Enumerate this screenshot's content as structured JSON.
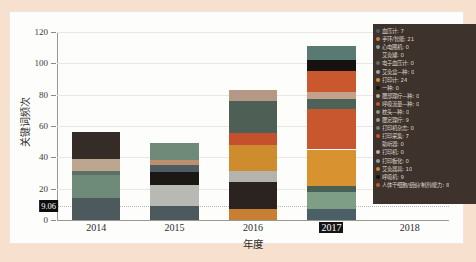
{
  "page": {
    "top_note": "",
    "background_color": "#f7e0cd",
    "card_color": "#fdfdfb"
  },
  "chart_data": {
    "type": "bar",
    "subtype": "stacked",
    "title": "",
    "xlabel": "年度",
    "ylabel": "关键词频次",
    "categories": [
      "2014",
      "2015",
      "2016",
      "2017",
      "2018"
    ],
    "highlighted_category": "2017",
    "ylim": [
      0,
      120
    ],
    "yticks": [
      0,
      20,
      40,
      60,
      80,
      100,
      120
    ],
    "grid": true,
    "legend_position": "right-inside",
    "threshold": {
      "value": 9.06,
      "label": "9.06"
    },
    "totals": [
      56,
      49,
      83,
      111,
      0
    ],
    "stacks": [
      {
        "category": "2014",
        "total": 56,
        "segments": [
          {
            "name": "血压计",
            "value": 14,
            "color": "#4c5a5e"
          },
          {
            "name": "手环/智能手表",
            "value": 15,
            "color": "#6e8a78"
          },
          {
            "name": "心电图机",
            "value": 2,
            "color": "#5d6f66"
          },
          {
            "name": "艾灸罐",
            "value": 8,
            "color": "#bda68f"
          },
          {
            "name": "电子血压计",
            "value": 17,
            "color": "#352b27"
          }
        ]
      },
      {
        "category": "2015",
        "total": 49,
        "segments": [
          {
            "name": "血压计",
            "value": 9,
            "color": "#4c5a5e"
          },
          {
            "name": "艾灸盒",
            "value": 13.5,
            "color": "#b9b9b3"
          },
          {
            "name": "打印机",
            "value": 8,
            "color": "#1b1714"
          },
          {
            "name": "一种",
            "value": 4.5,
            "color": "#4e5c63"
          },
          {
            "name": "腰部理疗",
            "value": 3,
            "color": "#bd8f6e"
          },
          {
            "name": "呼吸流量",
            "value": 11,
            "color": "#6f8a78"
          }
        ]
      },
      {
        "category": "2016",
        "total": 83,
        "segments": [
          {
            "name": "枕头",
            "value": 7,
            "color": "#c67f33"
          },
          {
            "name": "腰定理疗",
            "value": 17.5,
            "color": "#2b231f"
          },
          {
            "name": "打印机杂志",
            "value": 6.5,
            "color": "#b4b4ae"
          },
          {
            "name": "打印采集",
            "value": 17,
            "color": "#cf8c2e"
          },
          {
            "name": "助听器",
            "value": 7.5,
            "color": "#c4502d"
          },
          {
            "name": "打印机",
            "value": 20.5,
            "color": "#4e6055"
          },
          {
            "name": "打印板化",
            "value": 7,
            "color": "#b49a86"
          }
        ]
      },
      {
        "category": "2017",
        "total": 111,
        "segments": [
          {
            "name": "血压计",
            "value": 7,
            "color": "#4b6066"
          },
          {
            "name": "手环/智能手表",
            "value": 11,
            "color": "#7e9e86"
          },
          {
            "name": "心电图机",
            "value": 4,
            "color": "#4a6054"
          },
          {
            "name": "打印计",
            "value": 23,
            "color": "#d8922f"
          },
          {
            "name": "艾灸器具",
            "value": 26,
            "color": "#c8572f"
          },
          {
            "name": "呼吸机",
            "value": 6,
            "color": "#4f6257"
          },
          {
            "name": "腰定理疗",
            "value": 5,
            "color": "#c3a18a"
          },
          {
            "name": "打印采集",
            "value": 13,
            "color": "#c9582f"
          },
          {
            "name": "人体干细胞",
            "value": 7,
            "color": "#16120f"
          },
          {
            "name": "打印机",
            "value": 9,
            "color": "#597a73"
          }
        ]
      },
      {
        "category": "2018",
        "total": 0,
        "segments": []
      }
    ]
  },
  "legend": {
    "background_color": "#3d322c",
    "items": [
      {
        "label": "血压计: 7",
        "color": "#4b6066"
      },
      {
        "label": "手环/智能: 21",
        "color": "#c8823a"
      },
      {
        "label": "心电图机: 0",
        "color": "#8aa092"
      },
      {
        "label": "艾灸罐: 0",
        "color": "#3d322c"
      },
      {
        "label": "电子血压计: 0",
        "color": "#5a6f64"
      },
      {
        "label": "艾灸盒—种: 0",
        "color": "#9aa8a0"
      },
      {
        "label": "打印计: 24",
        "color": "#d8922f"
      },
      {
        "label": "一种: 0",
        "color": "#14110f"
      },
      {
        "label": "腰部理疗—种: 0",
        "color": "#b9a894"
      },
      {
        "label": "呼吸流量—种: 0",
        "color": "#c05b2e"
      },
      {
        "label": "枕头—种: 0",
        "color": "#7e9e86"
      },
      {
        "label": "腰定理疗: 9",
        "color": "#9a9a93"
      },
      {
        "label": "打印机杂志: 0",
        "color": "#6c8279"
      },
      {
        "label": "打印采集: 7",
        "color": "#c8572f"
      },
      {
        "label": "助听器: 0",
        "color": "#3d322c"
      },
      {
        "label": "打印机: 0",
        "color": "#b6b0a6"
      },
      {
        "label": "打印板化: 0",
        "color": "#8f9f97"
      },
      {
        "label": "艾灸器具: 10",
        "color": "#c8823a"
      },
      {
        "label": "呼吸机: 9",
        "color": "#14110f"
      },
      {
        "label": "人体干细胞/组织/制剂/能力: 8",
        "color": "#c05b2e"
      }
    ]
  }
}
